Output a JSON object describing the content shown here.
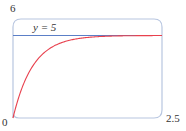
{
  "chart_data": {
    "type": "line",
    "title": "",
    "xlabel": "",
    "ylabel": "",
    "xlim": [
      0,
      2.5
    ],
    "ylim": [
      0,
      6
    ],
    "grid": false,
    "tick_labels": {
      "y_max": "6",
      "origin": "0",
      "x_max": "2.5"
    },
    "series": [
      {
        "name": "y = 5(1 - e^(-3t))",
        "kind": "curve",
        "color": "#e8414e",
        "x": [
          0,
          0.1,
          0.2,
          0.3,
          0.4,
          0.5,
          0.75,
          1.0,
          1.25,
          1.5,
          2.0,
          2.5
        ],
        "y": [
          0,
          1.3,
          2.26,
          2.97,
          3.49,
          3.88,
          4.47,
          4.75,
          4.88,
          4.94,
          4.99,
          5.0
        ]
      },
      {
        "name": "y = 5",
        "kind": "asymptote",
        "color": "#5b7fc7",
        "x": [
          0,
          2.5
        ],
        "y": [
          5,
          5
        ]
      }
    ],
    "annotations": [
      {
        "text": "y = 5",
        "x": 0.35,
        "y": 5.4
      }
    ]
  },
  "labels": {
    "y_max": "6",
    "origin": "0",
    "x_max": "2.5",
    "asymptote": "y = 5"
  },
  "colors": {
    "frame": "#b8c6e0",
    "curve": "#e8414e",
    "asymptote": "#5b7fc7",
    "text": "#333333"
  }
}
